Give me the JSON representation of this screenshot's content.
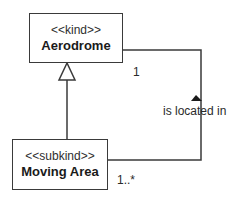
{
  "diagram": {
    "type": "UML class diagram",
    "classes": [
      {
        "id": "aerodrome",
        "stereotype": "<<kind>>",
        "name": "Aerodrome"
      },
      {
        "id": "moving_area",
        "stereotype": "<<subkind>>",
        "name": "Moving Area"
      }
    ],
    "generalization": {
      "from": "Moving Area",
      "to": "Aerodrome",
      "arrow": "hollow-triangle"
    },
    "association": {
      "name": "is located in",
      "direction_arrow": "filled-triangle-up",
      "ends": [
        {
          "class": "Aerodrome",
          "multiplicity": "1"
        },
        {
          "class": "Moving Area",
          "multiplicity": "1..*"
        }
      ]
    },
    "colors": {
      "line": "#3a3a3a",
      "text": "#1a1a1a",
      "background": "#ffffff"
    }
  }
}
